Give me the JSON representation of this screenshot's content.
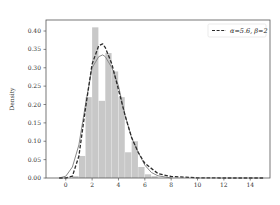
{
  "chart_data": {
    "type": "bar",
    "title": "",
    "xlabel": "",
    "ylabel": "Density",
    "xlim": [
      -1.5,
      15.5
    ],
    "ylim": [
      0,
      0.43
    ],
    "xticks": [
      0,
      2,
      4,
      6,
      8,
      10,
      12,
      14
    ],
    "xtick_labels": [
      "0",
      "2",
      "4",
      "6",
      "8",
      "10",
      "12",
      "14"
    ],
    "yticks": [
      0.0,
      0.05,
      0.1,
      0.15,
      0.2,
      0.25,
      0.3,
      0.35,
      0.4
    ],
    "ytick_labels": [
      "0.00",
      "0.05",
      "0.10",
      "0.15",
      "0.20",
      "0.25",
      "0.30",
      "0.35",
      "0.40"
    ],
    "grid": false,
    "legend_position": "upper right",
    "histogram": {
      "name": "samples",
      "color": "#c8c8c8",
      "bin_width": 0.5,
      "bin_starts": [
        0.5,
        1.0,
        1.5,
        2.0,
        2.5,
        3.0,
        3.5,
        4.0,
        4.5,
        5.0,
        5.5,
        6.0,
        6.5
      ],
      "density": [
        0.005,
        0.06,
        0.22,
        0.41,
        0.21,
        0.34,
        0.29,
        0.22,
        0.07,
        0.1,
        0.03,
        0.01,
        0.005
      ]
    },
    "series": [
      {
        "name": "α=5.6, β=2",
        "style": "dashed",
        "color": "#2b2b2b",
        "x": [
          -0.5,
          0,
          0.5,
          1.0,
          1.5,
          2.0,
          2.5,
          2.8,
          3.0,
          3.5,
          4.0,
          4.5,
          5.0,
          5.5,
          6.0,
          7.0,
          8.0,
          10.0,
          12.0,
          15.0
        ],
        "values": [
          0.0,
          0.0,
          0.005,
          0.06,
          0.19,
          0.31,
          0.36,
          0.365,
          0.355,
          0.31,
          0.24,
          0.17,
          0.11,
          0.07,
          0.04,
          0.012,
          0.004,
          0.0005,
          0.0,
          0.0
        ]
      },
      {
        "name": "KDE",
        "style": "solid",
        "color": "#8a8a8a",
        "x": [
          -0.5,
          0,
          0.5,
          1.0,
          1.5,
          2.0,
          2.5,
          2.8,
          3.0,
          3.5,
          4.0,
          4.5,
          5.0,
          5.5,
          6.0,
          6.5,
          7.0,
          8.0
        ],
        "values": [
          0.0,
          0.005,
          0.03,
          0.09,
          0.2,
          0.3,
          0.33,
          0.335,
          0.33,
          0.3,
          0.25,
          0.17,
          0.11,
          0.07,
          0.035,
          0.015,
          0.006,
          0.0
        ]
      }
    ]
  },
  "legend": {
    "entry_label": "α=5.6, β=2"
  }
}
